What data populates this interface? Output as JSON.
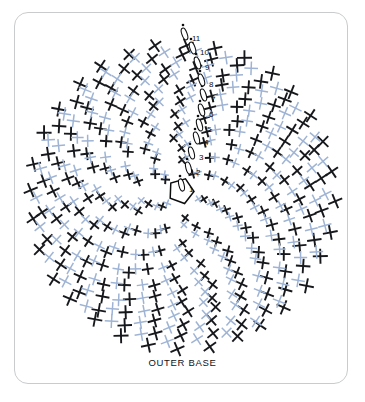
{
  "card": {
    "background": "#ffffff",
    "border_color": "#c9cbcd",
    "corner_radius": 14
  },
  "caption": {
    "text": "OUTER BASE"
  },
  "colors": {
    "thread_dark": "#16181c",
    "thread_light": "#9fb4d4",
    "hub_outline": "#0d0e10",
    "label_text": "#0d0e10",
    "page_background": "#ffffff"
  },
  "diagram": {
    "title": "OUTER BASE",
    "center_x": 182,
    "center_y": 196,
    "radius": 152,
    "hub": {
      "shape": "pentagon",
      "x": 181,
      "y": 191,
      "size": 13
    }
  },
  "stitch_labels": [
    {
      "label": "1",
      "x": 189,
      "y": 186
    },
    {
      "label": "2",
      "x": 196,
      "y": 169
    },
    {
      "label": "3",
      "x": 199,
      "y": 154
    },
    {
      "label": "4",
      "x": 204,
      "y": 139
    },
    {
      "label": "5",
      "x": 207,
      "y": 126
    },
    {
      "label": "6",
      "x": 209,
      "y": 111
    },
    {
      "label": "7",
      "x": 211,
      "y": 96
    },
    {
      "label": "8",
      "x": 209,
      "y": 81
    },
    {
      "label": "9",
      "x": 205,
      "y": 64
    },
    {
      "label": "10",
      "x": 200,
      "y": 49
    },
    {
      "label": "11",
      "x": 192,
      "y": 35
    }
  ],
  "chart_data": {
    "type": "diagram",
    "subtype": "radial-weave-crosshatch",
    "title": "OUTER BASE",
    "spokes": 32,
    "rings": 13,
    "spiral_twist_degrees": 58,
    "layers": [
      {
        "name": "dark thread",
        "color": "#16181c",
        "stroke": 1.9
      },
      {
        "name": "light thread",
        "color": "#9fb4d4",
        "stroke": 1.5
      }
    ],
    "numbered_positions": [
      "1",
      "2",
      "3",
      "4",
      "5",
      "6",
      "7",
      "8",
      "9",
      "10",
      "11"
    ],
    "labels": [
      "OUTER BASE"
    ]
  }
}
